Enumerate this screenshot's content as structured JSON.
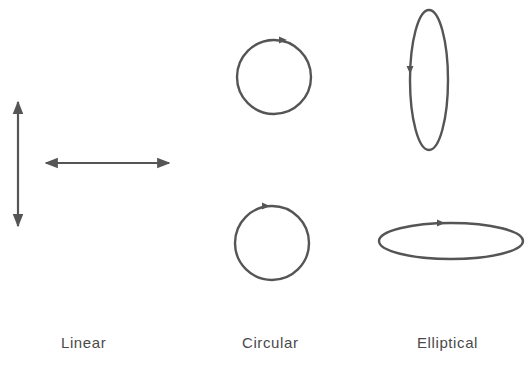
{
  "figure": {
    "stroke_color": "#555555",
    "labels": {
      "linear": "Linear",
      "circular": "Circular",
      "elliptical": "Elliptical"
    },
    "panels": [
      {
        "name": "linear",
        "shapes": [
          {
            "type": "double-arrow",
            "orientation": "vertical"
          },
          {
            "type": "double-arrow",
            "orientation": "horizontal"
          }
        ]
      },
      {
        "name": "circular",
        "shapes": [
          {
            "type": "circle",
            "direction": "clockwise"
          },
          {
            "type": "circle",
            "direction": "clockwise"
          }
        ]
      },
      {
        "name": "elliptical",
        "shapes": [
          {
            "type": "ellipse",
            "orientation": "vertical",
            "direction": "counterclockwise"
          },
          {
            "type": "ellipse",
            "orientation": "horizontal",
            "direction": "clockwise"
          }
        ]
      }
    ]
  }
}
